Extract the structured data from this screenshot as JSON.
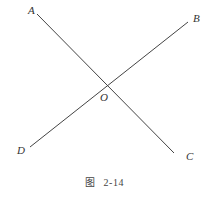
{
  "figure": {
    "caption_prefix": "图",
    "caption_number": "2-14",
    "line_color": "#444444",
    "points": {
      "A": {
        "label": "A",
        "x": 28,
        "y": 14
      },
      "B": {
        "label": "B",
        "x": 193,
        "y": 22
      },
      "C": {
        "label": "C",
        "x": 186,
        "y": 160
      },
      "D": {
        "label": "D",
        "x": 17,
        "y": 154
      },
      "O": {
        "label": "O",
        "x": 100,
        "y": 101
      }
    },
    "lines": [
      {
        "name": "AC",
        "x1": 37,
        "y1": 14,
        "x2": 174,
        "y2": 153
      },
      {
        "name": "DB",
        "x1": 30,
        "y1": 147,
        "x2": 188,
        "y2": 22
      }
    ]
  }
}
